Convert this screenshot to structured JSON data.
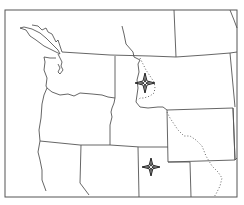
{
  "map": {
    "type": "outline-map",
    "region": "Pacific Northwest / Northern Rockies",
    "colors": {
      "background": "#ffffff",
      "border": "#555555",
      "coast": "#444444",
      "dotted_boundary": "#666666",
      "marker": "#222222"
    },
    "markers": [
      {
        "name": "star-marker-north",
        "x": 145,
        "y": 83
      },
      {
        "name": "star-marker-south",
        "x": 151,
        "y": 167
      }
    ]
  }
}
